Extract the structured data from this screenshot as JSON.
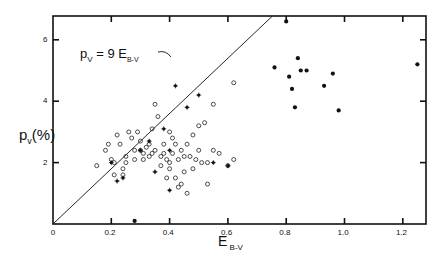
{
  "chart_data": {
    "type": "scatter",
    "title": "",
    "xlabel": "E B-V",
    "ylabel": "pV(%)",
    "xlim": [
      0,
      1.28
    ],
    "ylim": [
      0,
      6.9
    ],
    "x_ticks": [
      "0",
      "0.2",
      "0.4",
      "0.6",
      "0.8",
      "1.0",
      "1.2"
    ],
    "y_ticks": [
      "2",
      "4",
      "6"
    ],
    "grid": false,
    "annotation": "pV = 9 EB-V",
    "line": {
      "slope": 9,
      "label": "pV = 9 EB-V"
    },
    "series": [
      {
        "name": "open circles",
        "marker": "o",
        "points": [
          [
            0.15,
            1.9
          ],
          [
            0.18,
            2.4
          ],
          [
            0.19,
            2.6
          ],
          [
            0.2,
            2.1
          ],
          [
            0.21,
            2.0
          ],
          [
            0.21,
            1.6
          ],
          [
            0.22,
            2.9
          ],
          [
            0.23,
            2.6
          ],
          [
            0.24,
            1.8
          ],
          [
            0.24,
            1.6
          ],
          [
            0.25,
            2.2
          ],
          [
            0.25,
            2.0
          ],
          [
            0.26,
            3.0
          ],
          [
            0.27,
            2.8
          ],
          [
            0.28,
            2.4
          ],
          [
            0.28,
            2.1
          ],
          [
            0.29,
            3.0
          ],
          [
            0.3,
            2.7
          ],
          [
            0.3,
            2.4
          ],
          [
            0.31,
            2.3
          ],
          [
            0.31,
            2.1
          ],
          [
            0.32,
            2.5
          ],
          [
            0.33,
            2.6
          ],
          [
            0.33,
            2.2
          ],
          [
            0.34,
            2.3
          ],
          [
            0.34,
            3.1
          ],
          [
            0.35,
            3.9
          ],
          [
            0.35,
            2.4
          ],
          [
            0.36,
            3.5
          ],
          [
            0.37,
            1.9
          ],
          [
            0.37,
            2.2
          ],
          [
            0.38,
            2.3
          ],
          [
            0.38,
            2.6
          ],
          [
            0.39,
            2.1
          ],
          [
            0.39,
            1.5
          ],
          [
            0.4,
            1.8
          ],
          [
            0.4,
            3.0
          ],
          [
            0.4,
            2.0
          ],
          [
            0.41,
            2.3
          ],
          [
            0.41,
            2.8
          ],
          [
            0.42,
            1.5
          ],
          [
            0.42,
            2.6
          ],
          [
            0.43,
            1.2
          ],
          [
            0.43,
            2.1
          ],
          [
            0.44,
            1.3
          ],
          [
            0.44,
            2.4
          ],
          [
            0.45,
            1.7
          ],
          [
            0.45,
            2.2
          ],
          [
            0.46,
            2.6
          ],
          [
            0.46,
            1.0
          ],
          [
            0.47,
            2.2
          ],
          [
            0.48,
            2.9
          ],
          [
            0.48,
            1.8
          ],
          [
            0.49,
            2.1
          ],
          [
            0.5,
            2.4
          ],
          [
            0.5,
            3.2
          ],
          [
            0.51,
            2.0
          ],
          [
            0.52,
            3.3
          ],
          [
            0.53,
            1.3
          ],
          [
            0.53,
            2.0
          ],
          [
            0.55,
            2.4
          ],
          [
            0.57,
            2.3
          ],
          [
            0.6,
            1.9
          ],
          [
            0.62,
            2.1
          ],
          [
            0.62,
            4.6
          ],
          [
            0.55,
            3.9
          ]
        ]
      },
      {
        "name": "asterisks",
        "marker": "*",
        "points": [
          [
            0.2,
            2.0
          ],
          [
            0.22,
            1.4
          ],
          [
            0.24,
            1.5
          ],
          [
            0.3,
            2.4
          ],
          [
            0.33,
            2.7
          ],
          [
            0.35,
            1.7
          ],
          [
            0.38,
            3.1
          ],
          [
            0.4,
            2.4
          ],
          [
            0.42,
            4.5
          ],
          [
            0.46,
            3.8
          ],
          [
            0.5,
            4.2
          ],
          [
            0.55,
            2.0
          ],
          [
            0.6,
            1.9
          ],
          [
            0.4,
            1.1
          ]
        ]
      },
      {
        "name": "filled dots",
        "marker": "●",
        "points": [
          [
            0.28,
            0.1
          ],
          [
            0.76,
            5.1
          ],
          [
            0.8,
            6.6
          ],
          [
            0.81,
            4.8
          ],
          [
            0.82,
            4.4
          ],
          [
            0.83,
            3.8
          ],
          [
            0.84,
            5.4
          ],
          [
            0.85,
            5.0
          ],
          [
            0.87,
            5.0
          ],
          [
            0.93,
            4.5
          ],
          [
            0.96,
            4.9
          ],
          [
            0.98,
            3.7
          ],
          [
            1.25,
            5.2
          ]
        ]
      }
    ]
  }
}
